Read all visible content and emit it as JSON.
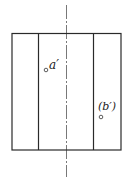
{
  "diagram": {
    "type": "orthographic-front-view-cylinder",
    "labels": {
      "point_a": "a′",
      "point_b": "(b′)"
    },
    "colors": {
      "line": "#2a2a2a",
      "background": "#ffffff"
    }
  }
}
